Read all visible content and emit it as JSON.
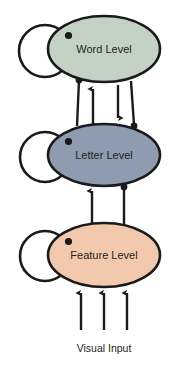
{
  "diagram": {
    "background_color": "#ffffff",
    "stroke_color": "#1a1a1a",
    "text_color": "#231f20",
    "levels": [
      {
        "id": "word-level",
        "label": "Word Level",
        "fill": "#c3d2c4",
        "cx": 104,
        "cy": 49,
        "rx": 56,
        "ry": 33,
        "self_loop": {
          "cx": 45,
          "cy": 51,
          "r": 26,
          "terminator": "dot"
        }
      },
      {
        "id": "letter-level",
        "label": "Letter Level",
        "fill": "#8e9bb0",
        "cx": 104,
        "cy": 155,
        "rx": 56,
        "ry": 31,
        "self_loop": {
          "cx": 45,
          "cy": 157,
          "r": 25,
          "terminator": "dot"
        }
      },
      {
        "id": "feature-level",
        "label": "Feature Level",
        "fill": "#f2c9ad",
        "cx": 104,
        "cy": 255,
        "rx": 56,
        "ry": 32,
        "self_loop": {
          "cx": 45,
          "cy": 256,
          "r": 25,
          "terminator": "dot"
        }
      }
    ],
    "connections": [
      {
        "id": "word-to-letter-inhibitory-left",
        "from": "word-level",
        "to": "letter-level",
        "terminator": "dot",
        "direction": "down"
      },
      {
        "id": "letter-to-word-excitatory",
        "from": "letter-level",
        "to": "word-level",
        "terminator": "arrow",
        "direction": "up"
      },
      {
        "id": "word-to-letter-excitatory",
        "from": "word-level",
        "to": "letter-level",
        "terminator": "arrow",
        "direction": "down"
      },
      {
        "id": "letter-to-word-inhibitory-right",
        "from": "letter-level",
        "to": "word-level",
        "terminator": "dot",
        "direction": "up"
      },
      {
        "id": "feature-to-letter-excitatory",
        "from": "feature-level",
        "to": "letter-level",
        "terminator": "arrow",
        "direction": "up"
      },
      {
        "id": "feature-to-letter-inhibitory",
        "from": "feature-level",
        "to": "letter-level",
        "terminator": "dot",
        "direction": "up"
      }
    ],
    "input": {
      "label": "Visual Input",
      "arrow_count": 3,
      "direction": "up"
    }
  }
}
